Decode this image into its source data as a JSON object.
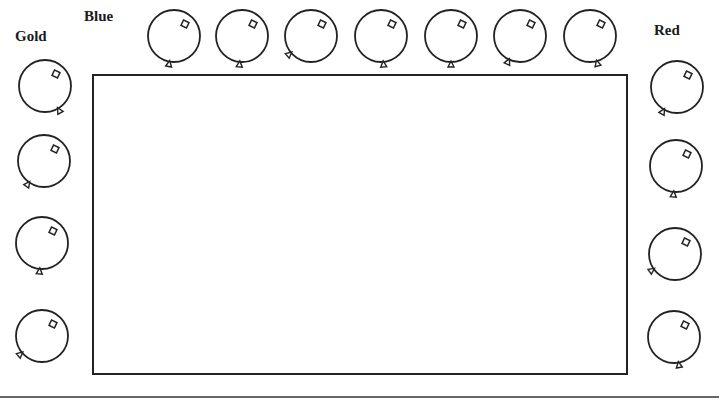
{
  "labels": {
    "gold": "Gold",
    "blue": "Blue",
    "red": "Red"
  },
  "groups": {
    "blue": {
      "position": "top",
      "count": 7,
      "balloons": [
        {
          "cx": 174,
          "cy": 36,
          "knot": 100
        },
        {
          "cx": 242,
          "cy": 36,
          "knot": 95
        },
        {
          "cx": 311,
          "cy": 36,
          "knot": 140
        },
        {
          "cx": 381,
          "cy": 36,
          "knot": 85
        },
        {
          "cx": 451,
          "cy": 36,
          "knot": 90
        },
        {
          "cx": 520,
          "cy": 36,
          "knot": 115
        },
        {
          "cx": 590,
          "cy": 36,
          "knot": 75
        }
      ]
    },
    "gold": {
      "position": "left",
      "count": 4,
      "balloons": [
        {
          "cx": 45,
          "cy": 86,
          "knot": 60
        },
        {
          "cx": 44,
          "cy": 161,
          "knot": 125
        },
        {
          "cx": 42,
          "cy": 243,
          "knot": 95
        },
        {
          "cx": 42,
          "cy": 336,
          "knot": 140
        }
      ]
    },
    "red": {
      "position": "right",
      "count": 4,
      "balloons": [
        {
          "cx": 677,
          "cy": 87,
          "knot": 120
        },
        {
          "cx": 676,
          "cy": 166,
          "knot": 95
        },
        {
          "cx": 675,
          "cy": 254,
          "knot": 145
        },
        {
          "cx": 674,
          "cy": 337,
          "knot": 80
        }
      ]
    }
  },
  "board": {
    "content": ""
  }
}
